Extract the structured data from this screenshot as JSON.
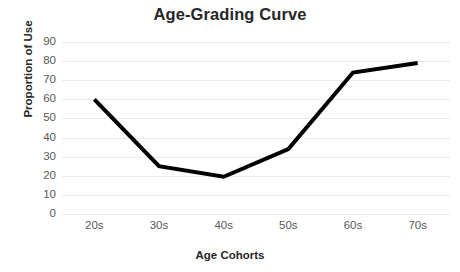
{
  "chart_data": {
    "type": "line",
    "title": "Age-Grading Curve",
    "xlabel": "Age Cohorts",
    "ylabel": "Proportion of Use",
    "categories": [
      "20s",
      "30s",
      "40s",
      "50s",
      "60s",
      "70s"
    ],
    "values": [
      60,
      25,
      19.5,
      34,
      74,
      79
    ],
    "series": [
      {
        "name": "Proportion of Use",
        "values": [
          60,
          25,
          19.5,
          34,
          74,
          79
        ],
        "color": "#000000",
        "line_width": 4,
        "markers": false
      }
    ],
    "ylim": [
      0,
      90
    ],
    "ytick_labels": [
      "90",
      "80",
      "70",
      "60",
      "50",
      "40",
      "30",
      "20",
      "10",
      "0"
    ],
    "ytick_values": [
      90,
      80,
      70,
      60,
      50,
      40,
      30,
      20,
      10,
      0
    ],
    "xlim_categories": 6,
    "grid": {
      "horizontal": true,
      "vertical": false,
      "color": "#eceaea"
    },
    "legend": {
      "visible": false,
      "position": "none"
    },
    "background": "#ffffff",
    "text_color": "#262626",
    "tick_color": "#595959"
  }
}
